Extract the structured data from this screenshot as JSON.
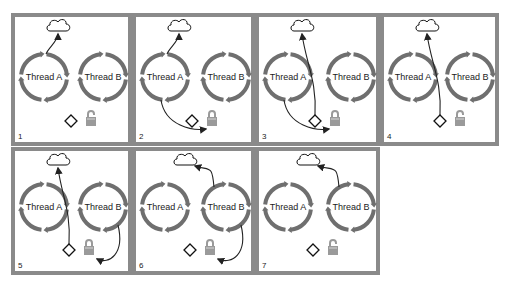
{
  "diagram": {
    "title": "",
    "thread_a_label": "Thread A",
    "thread_b_label": "Thread B",
    "colors": {
      "frame": "#8a8a8a",
      "ring": "#6f6f6f",
      "lock": "#9a9a9a",
      "arrow": "#222222"
    },
    "panels": [
      {
        "number": "1",
        "lock_state": "unlocked",
        "arrows": [
          {
            "from": "thread-a",
            "to": "cloud"
          }
        ]
      },
      {
        "number": "2",
        "lock_state": "locked",
        "arrows": [
          {
            "from": "thread-a",
            "to": "cloud"
          },
          {
            "from": "thread-a",
            "to": "lock"
          }
        ]
      },
      {
        "number": "3",
        "lock_state": "locked",
        "arrows": [
          {
            "from": "diamond",
            "to": "cloud"
          },
          {
            "from": "thread-a",
            "to": "lock"
          }
        ]
      },
      {
        "number": "4",
        "lock_state": "unlocked",
        "arrows": [
          {
            "from": "diamond",
            "to": "cloud"
          }
        ]
      },
      {
        "number": "5",
        "lock_state": "locked",
        "arrows": [
          {
            "from": "diamond",
            "to": "cloud"
          },
          {
            "from": "thread-b",
            "to": "lock"
          }
        ]
      },
      {
        "number": "6",
        "lock_state": "locked",
        "arrows": [
          {
            "from": "thread-b",
            "to": "cloud"
          },
          {
            "from": "thread-b",
            "to": "lock"
          }
        ]
      },
      {
        "number": "7",
        "lock_state": "unlocked",
        "arrows": [
          {
            "from": "thread-b",
            "to": "cloud"
          }
        ]
      }
    ]
  }
}
